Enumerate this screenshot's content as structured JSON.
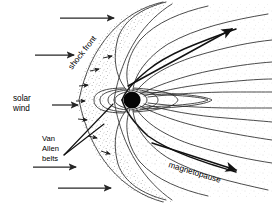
{
  "figure": {
    "background_color": "#ffffff",
    "line_color": "#2b2b2b",
    "width": 272,
    "height": 205
  },
  "labels": {
    "shock_front": "shock front",
    "solar_wind_line1": "solar",
    "solar_wind_line2": "wind",
    "van_allen_line1": "Van",
    "van_allen_line2": "Allen",
    "van_allen_line3": "belts",
    "magnetopause": "magnetopause"
  },
  "diagram_elements": {
    "earth": {
      "name": "earth-disc",
      "cx": 132,
      "cy": 100,
      "r": 8.5,
      "color": "#050505"
    },
    "bow_shock": {
      "name": "bow-shock-arc",
      "description": "outer parabolic arc opening to the right"
    },
    "magnetopause_boundary": {
      "name": "magnetopause-boundary",
      "description": "inner parabolic boundary opening to the right"
    },
    "magnetosheath": {
      "name": "magnetosheath-stipple",
      "description": "stippled region between shock front and magnetopause"
    },
    "plasma_sheet": {
      "name": "plasma-sheet-lens",
      "description": "lens shape in the magnetotail right of Earth"
    },
    "closed_field_lines": {
      "name": "closed-dipole-field-lines",
      "count": 5
    },
    "open_tail_field_lines": {
      "name": "open-tail-field-lines",
      "count": 8
    }
  },
  "solar_wind_arrows": [
    {
      "name": "solar-wind-arrow-1",
      "x1": 60,
      "y1": 18,
      "x2": 116,
      "y2": 18
    },
    {
      "name": "solar-wind-arrow-2",
      "x1": 35,
      "y1": 55,
      "x2": 76,
      "y2": 55
    },
    {
      "name": "solar-wind-arrow-3",
      "x1": 52,
      "y1": 105,
      "x2": 80,
      "y2": 105
    },
    {
      "name": "solar-wind-arrow-4",
      "x1": 33,
      "y1": 167,
      "x2": 78,
      "y2": 167
    },
    {
      "name": "solar-wind-arrow-5",
      "x1": 58,
      "y1": 188,
      "x2": 113,
      "y2": 188
    }
  ],
  "sheath_flow_arrows": [
    {
      "name": "sheath-arrow-1",
      "x1": 103,
      "y1": 58,
      "x2": 113,
      "y2": 56
    },
    {
      "name": "sheath-arrow-2",
      "x1": 90,
      "y1": 70,
      "x2": 100,
      "y2": 68
    },
    {
      "name": "sheath-arrow-3",
      "x1": 79,
      "y1": 85,
      "x2": 90,
      "y2": 84
    },
    {
      "name": "sheath-arrow-4",
      "x1": 76,
      "y1": 100,
      "x2": 87,
      "y2": 100
    },
    {
      "name": "sheath-arrow-5",
      "x1": 78,
      "y1": 118,
      "x2": 89,
      "y2": 119
    },
    {
      "name": "sheath-arrow-6",
      "x1": 88,
      "y1": 135,
      "x2": 99,
      "y2": 137
    },
    {
      "name": "sheath-arrow-7",
      "x1": 101,
      "y1": 150,
      "x2": 112,
      "y2": 153
    }
  ],
  "pointer_arrows": [
    {
      "name": "magnetopause-pointer-arrow",
      "x1": 152,
      "y1": 143,
      "x2": 238,
      "y2": 170
    },
    {
      "name": "magnetopause-upper-arrow",
      "x1": 120,
      "y1": 82,
      "x2": 234,
      "y2": 28
    }
  ]
}
